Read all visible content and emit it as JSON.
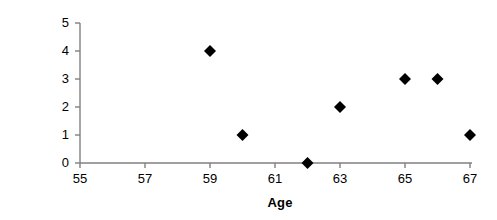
{
  "chart_data": {
    "type": "scatter",
    "title": "",
    "xlabel": "Age",
    "ylabel": "Number of Accidents",
    "x": [
      59,
      60,
      62,
      63,
      65,
      66,
      67
    ],
    "values": [
      4,
      1,
      0,
      2,
      3,
      3,
      1
    ],
    "points": [
      {
        "x": 59,
        "y": 4
      },
      {
        "x": 60,
        "y": 1
      },
      {
        "x": 62,
        "y": 0
      },
      {
        "x": 63,
        "y": 2
      },
      {
        "x": 65,
        "y": 3
      },
      {
        "x": 66,
        "y": 3
      },
      {
        "x": 67,
        "y": 1
      }
    ],
    "xlim": [
      55,
      67
    ],
    "ylim": [
      0,
      5
    ],
    "xticks": [
      55,
      57,
      59,
      61,
      63,
      65,
      67
    ],
    "yticks": [
      0,
      1,
      2,
      3,
      4,
      5
    ],
    "xtick_labels": [
      "55",
      "57",
      "59",
      "61",
      "63",
      "65",
      "67"
    ],
    "ytick_labels": [
      "0",
      "1",
      "2",
      "3",
      "4",
      "5"
    ],
    "grid": false,
    "legend": false,
    "marker": "diamond",
    "marker_color": "#000000",
    "axis_color": "#808080",
    "background_color": "#ffffff"
  }
}
